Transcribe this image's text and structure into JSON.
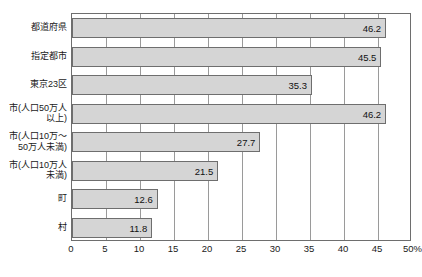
{
  "chart_data": {
    "type": "bar",
    "orientation": "horizontal",
    "title": "",
    "xlabel": "",
    "ylabel": "",
    "xlim": [
      0,
      50
    ],
    "grid": true,
    "legend": "none",
    "axis_unit": "%",
    "xticks": [
      "0",
      "5",
      "10",
      "15",
      "20",
      "25",
      "30",
      "35",
      "40",
      "45",
      "50%"
    ],
    "xtick_values": [
      0,
      5,
      10,
      15,
      20,
      25,
      30,
      35,
      40,
      45,
      50
    ],
    "categories": [
      "都道府県",
      "指定都市",
      "東京23区",
      "市(人口50万人\n以上)",
      "市(人口10万〜\n50万人未満)",
      "市(人口10万人\n未満)",
      "町",
      "村"
    ],
    "values": [
      46.2,
      45.5,
      35.3,
      46.2,
      27.7,
      21.5,
      12.6,
      11.8
    ],
    "value_labels": [
      "46.2",
      "45.5",
      "35.3",
      "46.2",
      "27.7",
      "21.5",
      "12.6",
      "11.8"
    ]
  },
  "style": {
    "bar_fill": "#d5d5d5",
    "bar_stroke": "#6e6e6e",
    "grid_color": "#9a9a9a",
    "frame_color": "#6e6e6e",
    "text_color": "#1a1a1a",
    "background": "#ffffff"
  }
}
